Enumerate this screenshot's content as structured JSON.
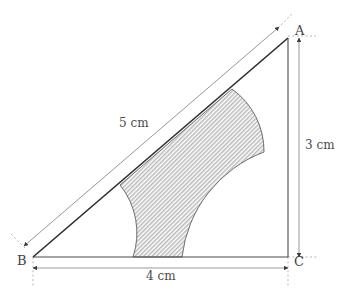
{
  "figure": {
    "vertices": {
      "A": {
        "label": "A",
        "x": 288,
        "y": 38
      },
      "B": {
        "label": "B",
        "x": 33,
        "y": 257
      },
      "C": {
        "label": "C",
        "x": 288,
        "y": 257
      }
    },
    "dimensions": {
      "hypotenuse": {
        "label": "5 cm",
        "value": 5,
        "unit": "cm",
        "side": "AB"
      },
      "vertical": {
        "label": "3 cm",
        "value": 3,
        "unit": "cm",
        "side": "AC"
      },
      "horizontal": {
        "label": "4 cm",
        "value": 4,
        "unit": "cm",
        "side": "BC"
      }
    },
    "colors": {
      "line": "#4a4a4a",
      "hypotenuse_line": "#2b2b2b",
      "dimension_line": "#8c8c8c",
      "dashed_extension": "#b0b0b0",
      "shade_fill": "#c8c8c8",
      "shade_outline": "#5a5a5a",
      "text": "#4a4a4a",
      "background": "#ffffff"
    },
    "shaded_region": {
      "description": "region bounded by hypotenuse AB and three concave circular arcs centred at A, B and C",
      "fill_style": "fine-diagonal-hatch",
      "arc_radii": {
        "at_A": 1.5,
        "at_B": 1.5,
        "at_C": 2.5
      }
    }
  }
}
